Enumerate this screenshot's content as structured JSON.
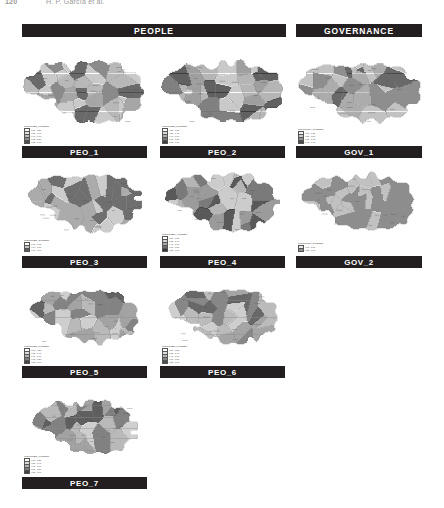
{
  "running_head": {
    "page_number": "120",
    "authors": "H. P. García et al."
  },
  "sections": [
    {
      "id": "people",
      "label": "PEOPLE"
    },
    {
      "id": "governance",
      "label": "GOVERNANCE"
    }
  ],
  "panels": [
    {
      "id": "peo1",
      "label": "PEO_1",
      "section": "people",
      "legend_title": "Legend PEO_1 indicator",
      "legend_items": [
        {
          "color": "#ffffff",
          "range": "0.00 - 0.20"
        },
        {
          "color": "#e0e0e0",
          "range": "0.21 - 0.40"
        },
        {
          "color": "#bdbdbd",
          "range": "0.41 - 0.60"
        },
        {
          "color": "#8a8a8a",
          "range": "0.61 - 0.80"
        },
        {
          "color": "#4d4d4d",
          "range": "0.81 - 1.00"
        }
      ]
    },
    {
      "id": "peo2",
      "label": "PEO_2",
      "section": "people",
      "legend_title": "Legend PEO_2 indicator",
      "legend_items": [
        {
          "color": "#ffffff",
          "range": "0.00 - 0.20"
        },
        {
          "color": "#d9d9d9",
          "range": "0.21 - 0.40"
        },
        {
          "color": "#b0b0b0",
          "range": "0.41 - 0.60"
        },
        {
          "color": "#767676",
          "range": "0.61 - 0.80"
        },
        {
          "color": "#3d3d3d",
          "range": "0.81 - 1.00"
        }
      ]
    },
    {
      "id": "gov1",
      "label": "GOV_1",
      "section": "governance",
      "legend_title": "Legend GOV_1 indicator",
      "legend_items": [
        {
          "color": "#f2f2f2",
          "range": "0.00 - 0.25"
        },
        {
          "color": "#c9c9c9",
          "range": "0.26 - 0.50"
        },
        {
          "color": "#909090",
          "range": "0.51 - 0.75"
        },
        {
          "color": "#4a4a4a",
          "range": "0.76 - 1.00"
        }
      ]
    },
    {
      "id": "peo3",
      "label": "PEO_3",
      "section": "people",
      "legend_title": "Legend PEO_3 indicator",
      "legend_items": [
        {
          "color": "#ffffff",
          "range": "0.00 - 0.33"
        },
        {
          "color": "#c4c4c4",
          "range": "0.34 - 0.66"
        },
        {
          "color": "#5a5a5a",
          "range": "0.67 - 1.00"
        }
      ]
    },
    {
      "id": "peo4",
      "label": "PEO_4",
      "section": "people",
      "legend_title": "Legend PEO_4 indicator",
      "legend_items": [
        {
          "color": "#ffffff",
          "range": "0.00 - 0.20"
        },
        {
          "color": "#d6d6d6",
          "range": "0.21 - 0.40"
        },
        {
          "color": "#a8a8a8",
          "range": "0.41 - 0.60"
        },
        {
          "color": "#6e6e6e",
          "range": "0.61 - 0.80"
        },
        {
          "color": "#333333",
          "range": "0.81 - 1.00"
        }
      ]
    },
    {
      "id": "gov2",
      "label": "GOV_2",
      "section": "governance",
      "legend_title": "Legend GOV_2 indicator",
      "legend_items": [
        {
          "color": "#ebebeb",
          "range": "0.00 - 0.50"
        },
        {
          "color": "#8f8f8f",
          "range": "0.51 - 1.00"
        }
      ]
    },
    {
      "id": "peo5",
      "label": "PEO_5",
      "section": "people",
      "legend_title": "Legend PEO_5 indicator",
      "legend_items": [
        {
          "color": "#ffffff",
          "range": "0.00 - 0.20"
        },
        {
          "color": "#dcdcdc",
          "range": "0.21 - 0.40"
        },
        {
          "color": "#b5b5b5",
          "range": "0.41 - 0.60"
        },
        {
          "color": "#7d7d7d",
          "range": "0.61 - 0.80"
        },
        {
          "color": "#454545",
          "range": "0.81 - 1.00"
        }
      ]
    },
    {
      "id": "peo6",
      "label": "PEO_6",
      "section": "people",
      "legend_title": "Legend PEO_6 indicator",
      "legend_items": [
        {
          "color": "#ffffff",
          "range": "0.00 - 0.20"
        },
        {
          "color": "#dedede",
          "range": "0.21 - 0.40"
        },
        {
          "color": "#b8b8b8",
          "range": "0.41 - 0.60"
        },
        {
          "color": "#858585",
          "range": "0.61 - 0.80"
        },
        {
          "color": "#4f4f4f",
          "range": "0.81 - 1.00"
        }
      ]
    },
    {
      "id": "peo7",
      "label": "PEO_7",
      "section": "people",
      "legend_title": "Legend PEO_7 indicator",
      "legend_items": [
        {
          "color": "#ffffff",
          "range": "0.00 - 0.20"
        },
        {
          "color": "#dadada",
          "range": "0.21 - 0.40"
        },
        {
          "color": "#b2b2b2",
          "range": "0.41 - 0.60"
        },
        {
          "color": "#7a7a7a",
          "range": "0.61 - 0.80"
        },
        {
          "color": "#414141",
          "range": "0.81 - 1.00"
        }
      ]
    }
  ],
  "colors": {
    "banner_bg": "#231f20",
    "banner_text": "#ffffff",
    "page_bg": "#ffffff",
    "map_outline": "#8c8c8c"
  }
}
